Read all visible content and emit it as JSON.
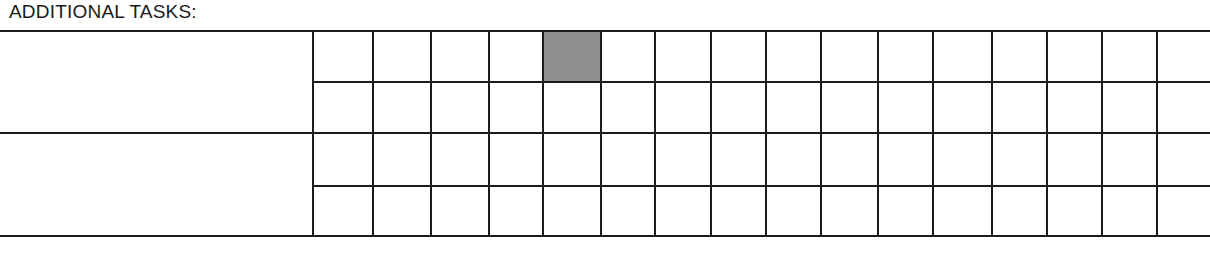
{
  "form": {
    "title": "ADDITIONAL TASKS:",
    "table": {
      "label_rows": [
        {
          "label": ""
        },
        {
          "label": ""
        }
      ],
      "grid_columns": 16,
      "grid_rows": 4,
      "column_x": [
        312,
        372,
        430,
        488,
        542,
        600,
        654,
        710,
        765,
        820,
        877,
        932,
        991,
        1046,
        1101,
        1156,
        1210
      ],
      "row_y": [
        30,
        81,
        132,
        185,
        235
      ],
      "shaded_cells": [
        {
          "row": 0,
          "col": 4,
          "color": "#8f8f8f"
        }
      ],
      "line_color": "#1b1b1b"
    }
  }
}
